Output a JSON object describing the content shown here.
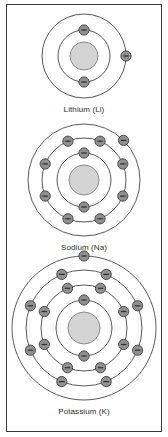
{
  "figure": {
    "title": "",
    "border_color": "#3a3a3a",
    "background": "#ffffff"
  },
  "style": {
    "shell_stroke": "#5a5a5a",
    "nucleus_fill": "#d4d4d4",
    "nucleus_stroke": "#8a8a8a",
    "electron_fill": "#909090",
    "electron_stroke": "#4a4a4a",
    "electron_sign": "−",
    "electron_sign_color": "#2e2e2e",
    "label_color": "#2b2b2b"
  },
  "chart_data": {
    "type": "diagram",
    "atoms": [
      {
        "id": "lithium",
        "name": "Lithium",
        "symbol": "Li",
        "label": "Lithium (Li)",
        "shell_counts": [
          2,
          1
        ],
        "nucleus_radius": 14,
        "shells": [
          {
            "radius": 26,
            "electrons": 2,
            "start_angle": -90
          },
          {
            "radius": 42,
            "electrons": 1,
            "start_angle": 0
          }
        ],
        "svg_size": 96
      },
      {
        "id": "sodium",
        "name": "Sodium",
        "symbol": "Na",
        "label": "Sodium (Na)",
        "shell_counts": [
          2,
          8,
          1
        ],
        "nucleus_radius": 15,
        "shells": [
          {
            "radius": 27,
            "electrons": 2,
            "start_angle": -90
          },
          {
            "radius": 42,
            "electrons": 8,
            "start_angle": -112.5
          },
          {
            "radius": 56,
            "electrons": 1,
            "start_angle": -45
          }
        ],
        "svg_size": 124
      },
      {
        "id": "potassium",
        "name": "Potassium",
        "symbol": "K",
        "label": "Potassium (K)",
        "shell_counts": [
          2,
          8,
          8,
          1
        ],
        "nucleus_radius": 16,
        "shells": [
          {
            "radius": 28,
            "electrons": 2,
            "start_angle": -90
          },
          {
            "radius": 43,
            "electrons": 8,
            "start_angle": -112.5
          },
          {
            "radius": 58,
            "electrons": 8,
            "start_angle": -112.5
          },
          {
            "radius": 72,
            "electrons": 1,
            "start_angle": -90
          }
        ],
        "svg_size": 156
      }
    ]
  }
}
